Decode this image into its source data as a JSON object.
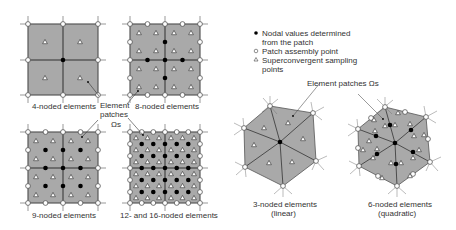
{
  "legend": {
    "items": [
      {
        "symbol": "filled-circle",
        "label_line1": "Nodal values determined",
        "label_line2": "from the patch"
      },
      {
        "symbol": "open-circle",
        "label_line1": "Patch assembly point",
        "label_line2": ""
      },
      {
        "symbol": "triangle",
        "label_line1": "Superconvergent sampling",
        "label_line2": "points"
      }
    ]
  },
  "panels": {
    "p4": {
      "label": "4-noded elements"
    },
    "p8": {
      "label": "8-noded elements"
    },
    "p9": {
      "label": "9-noded elements"
    },
    "p16": {
      "label": "12- and 16-noded elements"
    },
    "t3": {
      "label_line1": "3-noded elements",
      "label_line2": "(linear)"
    },
    "t6": {
      "label_line1": "6-noded elements",
      "label_line2": "(quadratic)"
    }
  },
  "annotations": {
    "left_patch_line1": "Element",
    "left_patch_line2": "patches",
    "left_patch_symbol": "Ωs",
    "right_patch": "Element patches Ωs"
  },
  "colors": {
    "fill": "#a9a9a9",
    "line": "#333333",
    "node": "#000000"
  }
}
